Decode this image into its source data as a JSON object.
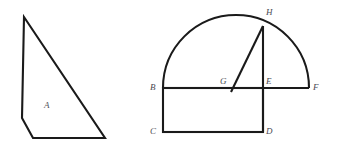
{
  "figure": {
    "background_color": "#ffffff",
    "stroke_color": "#1a1a1a",
    "label_color": "#4a4a52",
    "shapes": {
      "left": {
        "name": "quadrilateral-A",
        "description": "right triangle with clipped lower-left corner",
        "region_label": "A",
        "region_label_x": 44,
        "region_label_y": 101,
        "points": "24,17 22,118 33,138 105,138",
        "closed": true
      },
      "right": {
        "name": "semicircle-with-rectangle",
        "diameter_endpoints": {
          "left": "B",
          "right": "F"
        },
        "arc": {
          "center_x": 236,
          "center_y": 88,
          "radius": 73,
          "start_x": 163,
          "start_y": 88,
          "end_x": 309,
          "end_y": 88,
          "path": "M 163 88 A 73 73 0 0 1 309 88"
        },
        "diameter_line": {
          "x1": 163,
          "y1": 88,
          "x2": 309,
          "y2": 88
        },
        "rectangle": {
          "x": 163,
          "y": 88,
          "width": 100,
          "height": 44
        },
        "segment_HE": {
          "x1": 263,
          "y1": 26,
          "x2": 263,
          "y2": 132
        },
        "segment_HG": {
          "x1": 263,
          "y1": 26,
          "x2": 231,
          "y2": 92
        },
        "vertices": [
          {
            "id": "H",
            "label": "H",
            "px": 263,
            "py": 26,
            "label_x": 266,
            "label_y": 8
          },
          {
            "id": "B",
            "label": "B",
            "px": 163,
            "py": 88,
            "label_x": 150,
            "label_y": 83
          },
          {
            "id": "G",
            "label": "G",
            "px": 233,
            "py": 88,
            "label_x": 220,
            "label_y": 77
          },
          {
            "id": "E",
            "label": "E",
            "px": 263,
            "py": 88,
            "label_x": 266,
            "label_y": 77
          },
          {
            "id": "F",
            "label": "F",
            "px": 309,
            "py": 88,
            "label_x": 313,
            "label_y": 83
          },
          {
            "id": "C",
            "label": "C",
            "px": 163,
            "py": 132,
            "label_x": 150,
            "label_y": 127
          },
          {
            "id": "D",
            "label": "D",
            "px": 263,
            "py": 132,
            "label_x": 266,
            "label_y": 127
          }
        ]
      }
    }
  }
}
